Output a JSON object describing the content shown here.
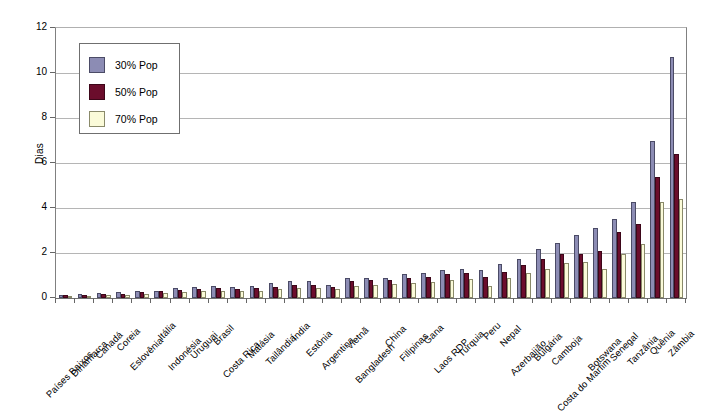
{
  "chart_data": {
    "type": "bar",
    "title": "",
    "subtitle": "",
    "xlabel": "",
    "ylabel": "Dias",
    "ylim": [
      0,
      12
    ],
    "ytick_step": 2,
    "yticks": [
      "0",
      "2",
      "4",
      "6",
      "8",
      "10",
      "12"
    ],
    "grid": true,
    "legend_position": "top-left-inside",
    "categories": [
      "Países Baixos",
      "Dinamarca",
      "Canadá",
      "Coreia",
      "Eslovênia",
      "Itália",
      "Indonésia",
      "Uruguai",
      "Brasil",
      "Costa Rica",
      "Malásia",
      "Tailândia",
      "Índia",
      "Estônia",
      "Argentina",
      "Vietnã",
      "Bangladesh",
      "China",
      "Filipinas",
      "Gana",
      "Laos RDP",
      "Turquia",
      "Peru",
      "Nepal",
      "Azerbaijão",
      "Bulgária",
      "Camboja",
      "Costa do Marfim",
      "Botswana",
      "Senegal",
      "Tanzânia",
      "Quênia",
      "Zâmbia"
    ],
    "series": [
      {
        "name": "30% Pop",
        "color": "#8c8cb4",
        "values": [
          0.15,
          0.2,
          0.22,
          0.25,
          0.3,
          0.33,
          0.45,
          0.5,
          0.55,
          0.5,
          0.55,
          0.65,
          0.75,
          0.75,
          0.6,
          0.9,
          0.9,
          0.9,
          1.05,
          1.1,
          1.25,
          1.3,
          1.25,
          1.5,
          1.75,
          2.2,
          2.45,
          2.8,
          3.1,
          3.5,
          4.25,
          7.0,
          10.7
        ]
      },
      {
        "name": "50% Pop",
        "color": "#6b0d2c",
        "values": [
          0.12,
          0.15,
          0.18,
          0.2,
          0.25,
          0.3,
          0.35,
          0.42,
          0.45,
          0.42,
          0.45,
          0.5,
          0.6,
          0.6,
          0.5,
          0.75,
          0.78,
          0.8,
          0.9,
          0.95,
          1.05,
          1.1,
          0.95,
          1.15,
          1.45,
          1.75,
          1.95,
          1.95,
          2.1,
          2.95,
          3.3,
          5.4,
          6.4
        ]
      },
      {
        "name": "70% Pop",
        "color": "#fbfbd9",
        "values": [
          0.1,
          0.1,
          0.12,
          0.15,
          0.18,
          0.22,
          0.25,
          0.3,
          0.32,
          0.3,
          0.32,
          0.38,
          0.45,
          0.45,
          0.38,
          0.55,
          0.6,
          0.62,
          0.68,
          0.72,
          0.8,
          0.85,
          0.55,
          0.9,
          1.1,
          1.3,
          1.55,
          1.6,
          1.3,
          1.95,
          2.4,
          4.25,
          4.4
        ]
      }
    ]
  },
  "legend": {
    "items": [
      {
        "label": "30% Pop"
      },
      {
        "label": "50% Pop"
      },
      {
        "label": "70% Pop"
      }
    ]
  },
  "axes": {
    "y_title": "Dias"
  }
}
